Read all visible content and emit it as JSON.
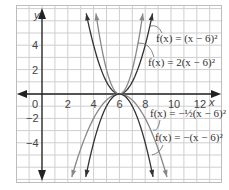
{
  "chart_data": {
    "type": "line",
    "title": "",
    "xlabel": "x",
    "ylabel": "y",
    "xlim": [
      -2,
      13.5
    ],
    "ylim": [
      -7,
      7
    ],
    "grid": true,
    "x_ticks": [
      "0",
      "2",
      "4",
      "6",
      "8",
      "10",
      "12"
    ],
    "y_ticks": [
      "4",
      "2",
      "-2",
      "-4"
    ],
    "series": [
      {
        "name": "f(x) = (x − 6)²",
        "a": 1,
        "h": 6,
        "color": "#333333"
      },
      {
        "name": "f(x) = 2(x − 6)²",
        "a": 2,
        "h": 6,
        "color": "#888888"
      },
      {
        "name": "f(x) = −½(x − 6)²",
        "a": -0.5,
        "h": 6,
        "color": "#888888"
      },
      {
        "name": "f(x) = −(x − 6)²",
        "a": -1,
        "h": 6,
        "color": "#333333"
      }
    ],
    "vertex": [
      6,
      0
    ]
  },
  "labels": {
    "x_axis": "x",
    "y_axis": "y",
    "eq1": "f(x) = (x − 6)²",
    "eq2": "f(x) = 2(x − 6)²",
    "eq3": "f(x) = −½(x − 6)²",
    "eq4": "f(x) = −(x − 6)²"
  }
}
